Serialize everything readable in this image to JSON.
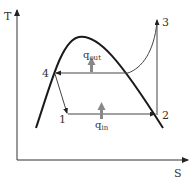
{
  "diagram": {
    "axes": {
      "y_label": "T",
      "x_label": "S"
    },
    "points": [
      {
        "id": "1",
        "label": "1"
      },
      {
        "id": "2",
        "label": "2"
      },
      {
        "id": "3",
        "label": "3"
      },
      {
        "id": "4",
        "label": "4"
      }
    ],
    "heat_flows": {
      "q_out": {
        "base": "q",
        "sub": "out"
      },
      "q_in": {
        "base": "q",
        "sub": "in"
      }
    },
    "colors": {
      "line": "#222222",
      "process_line": "#444444",
      "heat_arrow": "#888888",
      "text": "#333333",
      "background": "#ffffff"
    }
  }
}
